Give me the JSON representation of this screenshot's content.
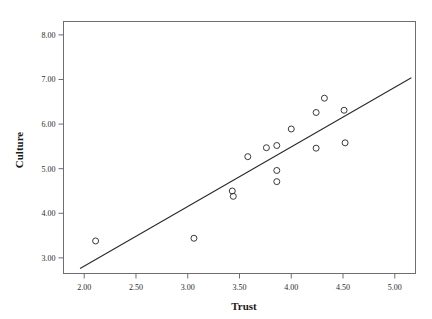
{
  "chart_data": {
    "type": "scatter",
    "title": "",
    "xlabel": "Trust",
    "ylabel": "Culture",
    "xlim": [
      1.8,
      5.2
    ],
    "ylim": [
      2.65,
      8.3
    ],
    "xticks": [
      2.0,
      2.5,
      3.0,
      3.5,
      4.0,
      4.5,
      5.0
    ],
    "xtick_labels": [
      "2.00",
      "2.50",
      "3.00",
      "3.50",
      "4.00",
      "4.50",
      "5.00"
    ],
    "yticks": [
      3.0,
      4.0,
      5.0,
      6.0,
      7.0,
      8.0
    ],
    "ytick_labels": [
      "3.00",
      "4.00",
      "5.00",
      "6.00",
      "7.00",
      "8.00"
    ],
    "grid": false,
    "legend": null,
    "marker": {
      "shape": "circle-open",
      "size": 3,
      "color": "#3a3a3a"
    },
    "points": [
      {
        "x": 2.11,
        "y": 3.38
      },
      {
        "x": 3.06,
        "y": 3.44
      },
      {
        "x": 3.43,
        "y": 4.5
      },
      {
        "x": 3.44,
        "y": 4.38
      },
      {
        "x": 3.58,
        "y": 5.27
      },
      {
        "x": 3.76,
        "y": 5.47
      },
      {
        "x": 3.86,
        "y": 5.52
      },
      {
        "x": 3.86,
        "y": 4.96
      },
      {
        "x": 3.86,
        "y": 4.71
      },
      {
        "x": 4.0,
        "y": 5.89
      },
      {
        "x": 4.24,
        "y": 6.26
      },
      {
        "x": 4.24,
        "y": 5.46
      },
      {
        "x": 4.32,
        "y": 6.58
      },
      {
        "x": 4.51,
        "y": 6.31
      },
      {
        "x": 4.52,
        "y": 5.58
      }
    ],
    "fit_line": {
      "type": "linear",
      "x_start": 1.96,
      "y_start": 2.76,
      "x_end": 5.16,
      "y_end": 7.04
    }
  },
  "axes": {
    "x_title": "Trust",
    "y_title": "Culture"
  }
}
